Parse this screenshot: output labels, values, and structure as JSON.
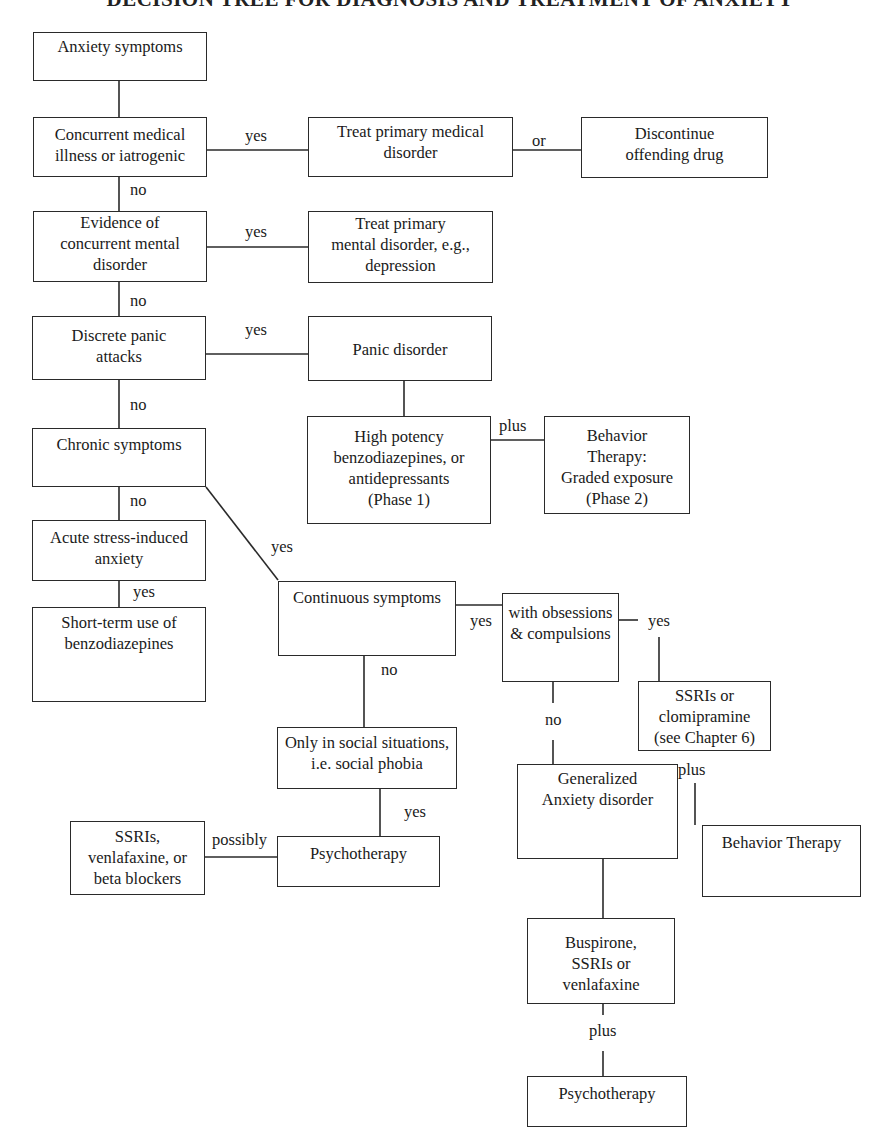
{
  "title": "DECISION TREE FOR DIAGNOSIS AND TREATMENT OF ANXIETY",
  "colors": {
    "line": "#2a2a2a",
    "text": "#1a1a1a",
    "background": "#ffffff"
  },
  "nodes": {
    "anxiety_symptoms": {
      "lines": [
        "Anxiety symptoms"
      ]
    },
    "concurrent_medical": {
      "lines": [
        "Concurrent medical",
        "illness or iatrogenic"
      ]
    },
    "treat_medical": {
      "lines": [
        "Treat primary medical",
        "disorder"
      ]
    },
    "discontinue_drug": {
      "lines": [
        "Discontinue",
        "offending drug"
      ]
    },
    "concurrent_mental": {
      "lines": [
        "Evidence of",
        "concurrent mental",
        "disorder"
      ]
    },
    "treat_mental": {
      "lines": [
        "Treat primary",
        "mental disorder, e.g.,",
        "depression"
      ]
    },
    "discrete_panic": {
      "lines": [
        "Discrete panic",
        "attacks"
      ]
    },
    "panic_disorder": {
      "lines": [
        "Panic disorder"
      ]
    },
    "chronic_symptoms": {
      "lines": [
        "Chronic symptoms"
      ]
    },
    "high_potency": {
      "lines": [
        "High potency",
        "benzodiazepines, or",
        "antidepressants",
        "(Phase 1)"
      ]
    },
    "behavior_graded": {
      "lines": [
        "Behavior",
        "Therapy:",
        "Graded exposure",
        "(Phase 2)"
      ]
    },
    "acute_stress": {
      "lines": [
        "Acute stress-induced",
        "anxiety"
      ]
    },
    "short_term_benzo": {
      "lines": [
        "Short-term use of",
        "benzodiazepines"
      ]
    },
    "continuous_symptoms": {
      "lines": [
        "Continuous symptoms"
      ]
    },
    "obsessions": {
      "lines": [
        "with obsessions",
        "& compulsions"
      ]
    },
    "ssri_clomipramine": {
      "lines": [
        "SSRIs or",
        "clomipramine",
        "(see Chapter 6)"
      ]
    },
    "social_situations": {
      "lines": [
        "Only in social situations,",
        "i.e. social phobia"
      ]
    },
    "generalized_anxiety": {
      "lines": [
        "Generalized",
        "Anxiety disorder"
      ]
    },
    "behavior_therapy": {
      "lines": [
        "Behavior Therapy"
      ]
    },
    "ssri_beta": {
      "lines": [
        "SSRIs,",
        "venlafaxine, or",
        "beta blockers"
      ]
    },
    "psychotherapy_social": {
      "lines": [
        "Psychotherapy"
      ]
    },
    "buspirone": {
      "lines": [
        "Buspirone,",
        "SSRIs or",
        "venlafaxine"
      ]
    },
    "psychotherapy_gad": {
      "lines": [
        "Psychotherapy"
      ]
    }
  },
  "edge_labels": {
    "medical_yes": "yes",
    "medical_or": "or",
    "medical_no": "no",
    "mental_yes": "yes",
    "mental_no": "no",
    "panic_yes": "yes",
    "panic_no": "no",
    "panic_plus": "plus",
    "chronic_no": "no",
    "chronic_yes": "yes",
    "acute_yes": "yes",
    "continuous_yes": "yes",
    "continuous_no": "no",
    "obsessions_yes": "yes",
    "obsessions_no": "no",
    "ssri_plus": "plus",
    "social_yes": "yes",
    "possibly": "possibly",
    "buspirone_plus": "plus"
  }
}
